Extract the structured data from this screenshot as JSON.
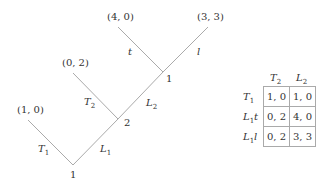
{
  "tree": {
    "nodes": [
      {
        "id": "root",
        "player": "1",
        "x": 73,
        "y": 165
      },
      {
        "id": "n2",
        "player": "2",
        "x": 118,
        "y": 119
      },
      {
        "id": "n3",
        "player": "1",
        "x": 163,
        "y": 72
      }
    ],
    "edges": [
      {
        "from": "root",
        "label": "T",
        "sub": "1",
        "to_payoff": "(1, 0)"
      },
      {
        "from": "root",
        "label": "L",
        "sub": "1",
        "to": "n2"
      },
      {
        "from": "n2",
        "label": "T",
        "sub": "2",
        "to_payoff": "(0, 2)"
      },
      {
        "from": "n2",
        "label": "L",
        "sub": "2",
        "to": "n3"
      },
      {
        "from": "n3",
        "label": "t",
        "sub": "",
        "to_payoff": "(4, 0)"
      },
      {
        "from": "n3",
        "label": "l",
        "sub": "",
        "to_payoff": "(3, 3)"
      }
    ],
    "payoffs": {
      "p1": "(1, 0)",
      "p2": "(0, 2)",
      "p3": "(4, 0)",
      "p4": "(3, 3)"
    },
    "players": {
      "root": "1",
      "n2": "2",
      "n3": "1"
    }
  },
  "table": {
    "col_headers": [
      {
        "label": "T",
        "sub": "2"
      },
      {
        "label": "L",
        "sub": "2"
      }
    ],
    "row_headers": [
      {
        "label": "T",
        "sub": "1",
        "suffix": ""
      },
      {
        "label": "L",
        "sub": "1",
        "suffix": "t"
      },
      {
        "label": "L",
        "sub": "1",
        "suffix": "l"
      }
    ],
    "cells": [
      [
        "1, 0",
        "1, 0"
      ],
      [
        "0, 2",
        "4, 0"
      ],
      [
        "0, 2",
        "3, 3"
      ]
    ]
  }
}
